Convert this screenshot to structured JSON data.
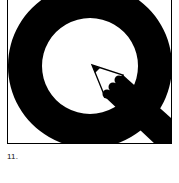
{
  "figure": {
    "caption": "11.",
    "logo": {
      "description": "Letter Q with pencil tail",
      "icon": "q-pencil-logo-icon",
      "colors": {
        "ink": "#000000",
        "paper": "#ffffff"
      }
    }
  }
}
